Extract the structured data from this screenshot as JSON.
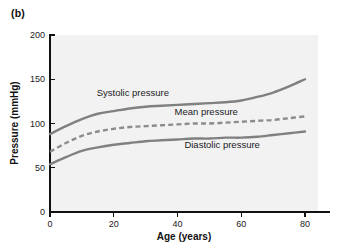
{
  "figure": {
    "panel_label": "(b)",
    "background_color": "#ffffff",
    "plot_background_color": "#f2f2f2",
    "axis_color": "#111111",
    "curve_color": "#808080"
  },
  "chart_data": {
    "type": "line",
    "title": "",
    "subtitle": "",
    "panel": "(b)",
    "xlabel": "Age (years)",
    "ylabel": "Pressure (mmHg)",
    "xlim": [
      0,
      80
    ],
    "ylim": [
      0,
      200
    ],
    "xticks": [
      0,
      20,
      40,
      60,
      80
    ],
    "yticks": [
      0,
      50,
      100,
      150,
      200
    ],
    "xtick_labels": [
      "0",
      "20",
      "40",
      "60",
      "80"
    ],
    "ytick_labels": [
      "0",
      "50",
      "100",
      "150",
      "200"
    ],
    "grid": false,
    "legend_position": "inline-annotations",
    "x": [
      0,
      5,
      10,
      15,
      20,
      25,
      30,
      35,
      40,
      45,
      50,
      55,
      60,
      65,
      70,
      75,
      80
    ],
    "series": [
      {
        "name": "Systolic pressure",
        "style": "solid",
        "color": "#808080",
        "values": [
          88,
          97,
          105,
          111,
          114,
          117,
          119,
          120,
          121,
          122,
          123,
          124,
          126,
          130,
          135,
          142,
          150
        ],
        "annotation": "Systolic pressure",
        "annotation_x": 26,
        "annotation_y": 131
      },
      {
        "name": "Mean pressure",
        "style": "dashed",
        "color": "#8c8c8c",
        "values": [
          68,
          78,
          86,
          91,
          94,
          96,
          97,
          98,
          99,
          100,
          100,
          101,
          102,
          103,
          104,
          106,
          108
        ],
        "annotation": "Mean pressure",
        "annotation_x": 49,
        "annotation_y": 110
      },
      {
        "name": "Diastolic pressure",
        "style": "solid",
        "color": "#808080",
        "values": [
          54,
          62,
          69,
          73,
          76,
          78,
          80,
          81,
          82,
          83,
          83,
          84,
          84,
          85,
          87,
          89,
          91
        ],
        "annotation": "Diastolic pressure",
        "annotation_x": 54,
        "annotation_y": 72
      }
    ]
  }
}
